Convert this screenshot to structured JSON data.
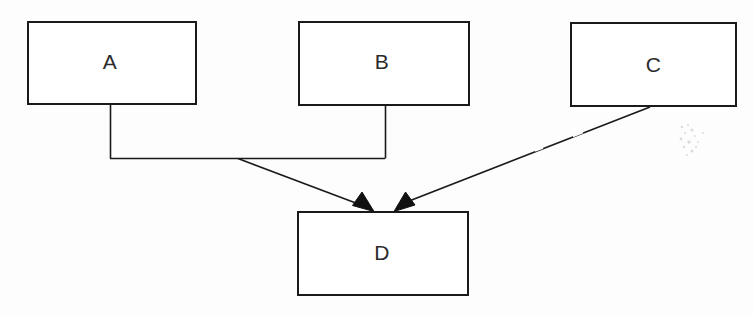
{
  "diagram": {
    "type": "node-link-diagram",
    "canvas": {
      "width": 754,
      "height": 316,
      "background": "#fdfdfd"
    },
    "stroke_color": "#1a1a1a",
    "text_color": "#2b2b2b",
    "nodes": [
      {
        "id": "A",
        "label": "A",
        "x": 27,
        "y": 21,
        "width": 170,
        "height": 84
      },
      {
        "id": "B",
        "label": "B",
        "x": 298,
        "y": 21,
        "width": 172,
        "height": 85
      },
      {
        "id": "C",
        "label": "C",
        "x": 570,
        "y": 22,
        "width": 167,
        "height": 85
      },
      {
        "id": "D",
        "label": "D",
        "x": 297,
        "y": 211,
        "width": 172,
        "height": 85
      }
    ],
    "edges": [
      {
        "from": "A",
        "to": "D",
        "style": "orthogonal-then-diagonal",
        "arrowhead": "filled-triangle"
      },
      {
        "from": "B",
        "to": "D",
        "style": "orthogonal-then-diagonal",
        "arrowhead": "filled-triangle"
      },
      {
        "from": "C",
        "to": "D",
        "style": "diagonal",
        "arrowhead": "filled-triangle"
      }
    ]
  }
}
